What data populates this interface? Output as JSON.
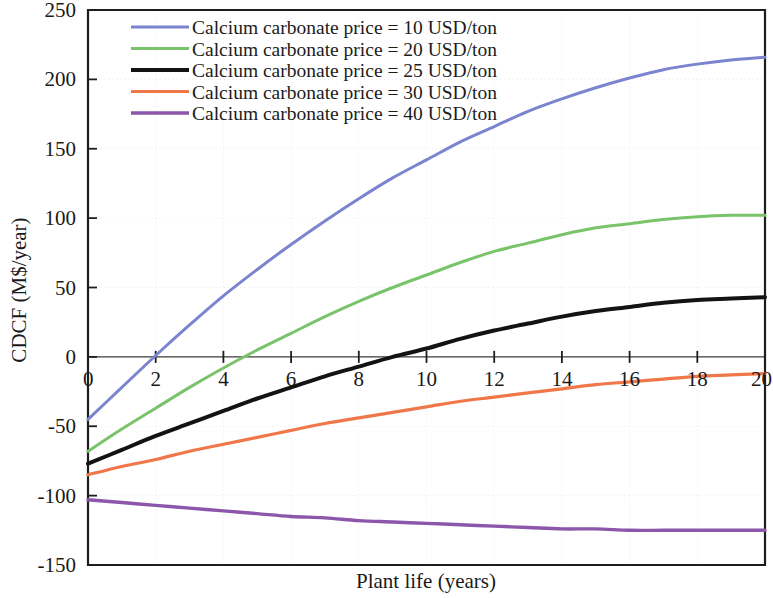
{
  "chart_data": {
    "type": "line",
    "title": "",
    "xlabel": "Plant life (years)",
    "ylabel": "CDCF (M$/year)",
    "xlim": [
      0,
      20
    ],
    "ylim": [
      -150,
      250
    ],
    "xticks": [
      0,
      2,
      4,
      6,
      8,
      10,
      12,
      14,
      16,
      18,
      20
    ],
    "yticks": [
      -150,
      -100,
      -50,
      0,
      50,
      100,
      150,
      200,
      250
    ],
    "xtick_labels": [
      "0",
      "2",
      "4",
      "6",
      "8",
      "10",
      "12",
      "14",
      "16",
      "18",
      "20"
    ],
    "ytick_labels": [
      "-150",
      "-100",
      "-50",
      "0",
      "50",
      "100",
      "150",
      "200",
      "250"
    ],
    "grid": true,
    "legend_position": "top-left-inside",
    "x": [
      0,
      1,
      2,
      3,
      4,
      5,
      6,
      7,
      8,
      9,
      10,
      11,
      12,
      13,
      14,
      15,
      16,
      17,
      18,
      19,
      20
    ],
    "series": [
      {
        "name": "Calcium carbonate price = 10 USD/ton",
        "color": "#7b84cf",
        "width": 3.0,
        "values": [
          -45,
          -22,
          1,
          23,
          44,
          63,
          81,
          98,
          114,
          129,
          142,
          155,
          166,
          177,
          186,
          194,
          201,
          207,
          211,
          214,
          216
        ]
      },
      {
        "name": "Calcium carbonate price = 20 USD/ton",
        "color": "#79c36a",
        "width": 3.0,
        "values": [
          -68,
          -52,
          -37,
          -22,
          -8,
          5,
          17,
          29,
          40,
          50,
          59,
          68,
          76,
          82,
          88,
          93,
          96,
          99,
          101,
          102,
          102
        ]
      },
      {
        "name": "Calcium carbonate price = 25 USD/ton",
        "color": "#131313",
        "width": 4.0,
        "values": [
          -77,
          -67,
          -57,
          -48,
          -39,
          -30,
          -22,
          -14,
          -7,
          0,
          6,
          13,
          19,
          24,
          29,
          33,
          36,
          39,
          41,
          42,
          43
        ]
      },
      {
        "name": "Calcium carbonate price = 30 USD/ton",
        "color": "#f0774a",
        "width": 3.2,
        "values": [
          -85,
          -79,
          -74,
          -68,
          -63,
          -58,
          -53,
          -48,
          -44,
          -40,
          -36,
          -32,
          -29,
          -26,
          -23,
          -20,
          -18,
          -16,
          -14,
          -13,
          -12
        ]
      },
      {
        "name": "Calcium carbonate price = 40 USD/ton",
        "color": "#8c56ab",
        "width": 3.4,
        "values": [
          -103,
          -105,
          -107,
          -109,
          -111,
          -113,
          -115,
          -116,
          -118,
          -119,
          -120,
          -121,
          -122,
          -123,
          -124,
          -124,
          -125,
          -125,
          -125,
          -125,
          -125
        ]
      }
    ]
  },
  "axes": {
    "x_title": "Plant life (years)",
    "y_title": "CDCF (M$/year)"
  },
  "legend": {
    "items": [
      {
        "label": "Calcium carbonate price = 10 USD/ton",
        "color": "#7b84cf"
      },
      {
        "label": "Calcium carbonate price = 20 USD/ton",
        "color": "#79c36a"
      },
      {
        "label": "Calcium carbonate price = 25 USD/ton",
        "color": "#131313"
      },
      {
        "label": "Calcium carbonate price = 30 USD/ton",
        "color": "#f0774a"
      },
      {
        "label": "Calcium carbonate price = 40 USD/ton",
        "color": "#8c56ab"
      }
    ]
  }
}
